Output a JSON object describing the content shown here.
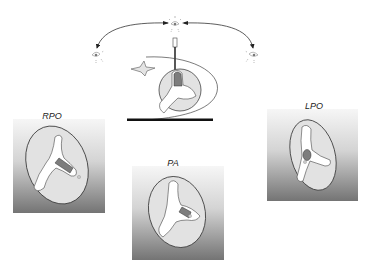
{
  "diagram": {
    "type": "echocardiography / gated blood-pool projection views diagram",
    "top_setup": {
      "detector_positions": [
        "left oblique eye",
        "anterior eye",
        "right oblique eye"
      ],
      "arrows": [
        "anterior-to-left arc",
        "anterior-to-right arc"
      ]
    },
    "views": [
      {
        "id": "rpo",
        "label": "RPO"
      },
      {
        "id": "pa",
        "label": "PA"
      },
      {
        "id": "lpo",
        "label": "LPO"
      }
    ],
    "colors": {
      "box_top": "#f4f4f4",
      "box_bottom": "#7a7a7a",
      "ellipse_fill": "#e2e2e2",
      "outline": "#3a3a3a",
      "chamber_fill": "#ffffff",
      "highlight_fill": "#7d7d7d",
      "bar": "#111111"
    }
  }
}
